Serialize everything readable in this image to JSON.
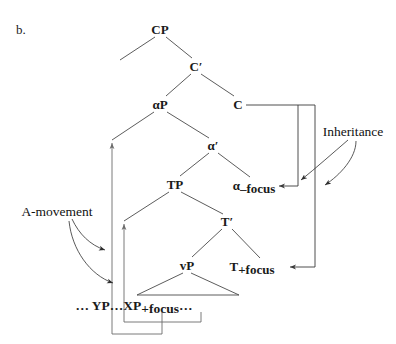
{
  "figure": {
    "item_label": "b.",
    "caption": "",
    "background_color": "#ffffff",
    "line_color": "#4a4a4a",
    "text_color": "#1a1a1a"
  },
  "tree": {
    "nodes": [
      {
        "id": "cp",
        "label": "CP",
        "sub": "",
        "x": 160,
        "y": 30
      },
      {
        "id": "cbar",
        "label": "C′",
        "sub": "",
        "x": 196,
        "y": 67
      },
      {
        "id": "alphap",
        "label": "αP",
        "sub": "",
        "x": 160,
        "y": 105
      },
      {
        "id": "c",
        "label": "C",
        "sub": "",
        "x": 238,
        "y": 105
      },
      {
        "id": "alphabar",
        "label": "α′",
        "sub": "",
        "x": 213,
        "y": 146
      },
      {
        "id": "tp",
        "label": "TP",
        "sub": "",
        "x": 175,
        "y": 185
      },
      {
        "id": "alphaneg",
        "label": "α",
        "sub": "–focus",
        "x": 258,
        "y": 186
      },
      {
        "id": "tbar",
        "label": "T′",
        "sub": "",
        "x": 227,
        "y": 222
      },
      {
        "id": "vp",
        "label": "vP",
        "sub": "",
        "x": 187,
        "y": 266
      },
      {
        "id": "tpos",
        "label": "T",
        "sub": "+focus",
        "x": 268,
        "y": 267
      }
    ],
    "terminal": {
      "id": "terminal-string",
      "text": "… YP…XP",
      "sub": "+focus",
      "tail": "…",
      "x": 187,
      "y": 305
    }
  },
  "annotations": [
    {
      "id": "inheritance",
      "label": "Inheritance",
      "x": 353,
      "y": 131,
      "description": "Feature inheritance from C to α–focus and T+focus"
    },
    {
      "id": "a-movement",
      "label": "A-movement",
      "x": 57,
      "y": 211,
      "description": "A-movement of YP and XP to specifier positions"
    }
  ],
  "legend_note": "Syntactic tree: feature inheritance and A-movement"
}
